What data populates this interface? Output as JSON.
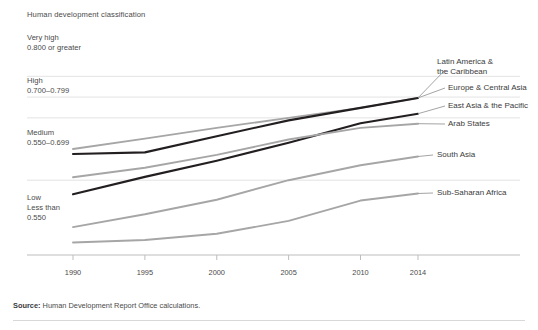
{
  "chart_title": "Human development classification",
  "bands": [
    {
      "name": "very-high",
      "l1": "Very high",
      "l2": "0.800 or greater",
      "l3": ""
    },
    {
      "name": "high",
      "l1": "High",
      "l2": "0.700–0.799",
      "l3": ""
    },
    {
      "name": "medium",
      "l1": "Medium",
      "l2": "0.550–0.699",
      "l3": ""
    },
    {
      "name": "low",
      "l1": "Low",
      "l2": "Less than",
      "l3": "0.550"
    }
  ],
  "source": {
    "prefix": "Source:",
    "text": " Human Development Report Office calculations."
  },
  "colors": {
    "dark_line": "#231f20",
    "gray_line": "#a6a6a6",
    "gridline": "#e3e3e3",
    "axis": "#bdbdbd",
    "text": "#4a4a4a"
  },
  "chart_data": {
    "type": "line",
    "title": "Human development classification",
    "xlabel": "",
    "ylabel": "Human Development Index (HDI)",
    "x": [
      1990,
      1995,
      2000,
      2005,
      2010,
      2014
    ],
    "xlim": [
      1990,
      2014
    ],
    "ylim": [
      0.37,
      0.82
    ],
    "xticks": [
      1990,
      1995,
      2000,
      2005,
      2010,
      2014
    ],
    "xticklabels": [
      "1990",
      "1995",
      "2000",
      "2005",
      "2010",
      "2014"
    ],
    "grid": "horizontal",
    "gridline_values": [
      0.8,
      0.75,
      0.7,
      0.55
    ],
    "legend": "right-inline-labels",
    "series": [
      {
        "name": "Latin America & the Caribbean",
        "color": "#a6a6a6",
        "values": [
          0.625,
          0.65,
          0.676,
          0.7,
          0.724,
          0.748
        ]
      },
      {
        "name": "Europe & Central Asia",
        "color": "#231f20",
        "values": [
          0.613,
          0.617,
          0.656,
          0.694,
          0.724,
          0.748
        ]
      },
      {
        "name": "East Asia & the Pacific",
        "color": "#231f20",
        "values": [
          0.516,
          0.558,
          0.597,
          0.64,
          0.687,
          0.71
        ]
      },
      {
        "name": "Arab States",
        "color": "#a6a6a6",
        "values": [
          0.557,
          0.58,
          0.611,
          0.648,
          0.676,
          0.686
        ]
      },
      {
        "name": "South Asia",
        "color": "#a6a6a6",
        "values": [
          0.437,
          0.468,
          0.503,
          0.55,
          0.586,
          0.607
        ]
      },
      {
        "name": "Sub-Saharan Africa",
        "color": "#a6a6a6",
        "values": [
          0.4,
          0.406,
          0.421,
          0.452,
          0.501,
          0.518
        ]
      }
    ]
  }
}
